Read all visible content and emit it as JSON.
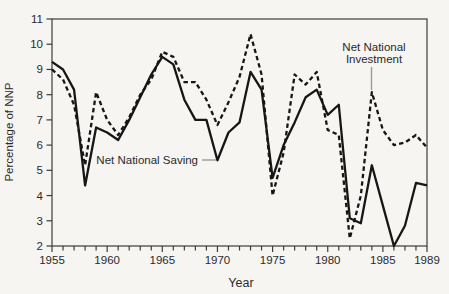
{
  "figure": {
    "background": "#f6f5f2",
    "line_color": "#161616",
    "leader_color": "#9b9b9b",
    "text_color": "#2a2a2a",
    "axis_color": "#3c3c3c"
  },
  "chart_data": {
    "type": "line",
    "title": "",
    "xlabel": "Year",
    "ylabel": "Percentage of NNP",
    "xlim": [
      1955,
      1989
    ],
    "ylim": [
      2,
      11
    ],
    "grid": false,
    "x": [
      1955,
      1956,
      1957,
      1958,
      1959,
      1960,
      1961,
      1962,
      1963,
      1964,
      1965,
      1966,
      1967,
      1968,
      1969,
      1970,
      1971,
      1972,
      1973,
      1974,
      1975,
      1976,
      1977,
      1978,
      1979,
      1980,
      1981,
      1982,
      1983,
      1984,
      1985,
      1986,
      1987,
      1988,
      1989
    ],
    "x_tick_labels": [
      1955,
      1960,
      1965,
      1970,
      1975,
      1980,
      1985,
      1989
    ],
    "y_ticks": [
      2,
      3,
      4,
      5,
      6,
      7,
      8,
      9,
      10,
      11
    ],
    "series": [
      {
        "name": "Net National Saving",
        "style": "solid",
        "values": [
          9.3,
          9.0,
          8.2,
          4.4,
          6.7,
          6.5,
          6.2,
          7.0,
          7.9,
          8.8,
          9.5,
          9.2,
          7.8,
          7.0,
          7.0,
          5.4,
          6.5,
          6.9,
          8.9,
          8.2,
          4.7,
          6.0,
          6.9,
          7.9,
          8.2,
          7.2,
          7.6,
          3.1,
          2.9,
          5.2,
          3.6,
          2.0,
          2.8,
          4.5,
          4.4
        ]
      },
      {
        "name": "Net National Investment",
        "style": "dashed",
        "values": [
          9.0,
          8.6,
          7.6,
          5.2,
          8.1,
          7.0,
          6.4,
          7.1,
          8.0,
          8.6,
          9.7,
          9.5,
          8.5,
          8.5,
          7.8,
          6.8,
          7.7,
          8.7,
          10.4,
          8.8,
          4.0,
          5.7,
          8.8,
          8.4,
          8.9,
          6.6,
          6.4,
          2.3,
          4.0,
          8.1,
          6.6,
          6.0,
          6.1,
          6.4,
          5.9
        ]
      }
    ],
    "annotations": [
      {
        "lines": [
          "Net National Saving"
        ],
        "series": "Net National Saving",
        "target_year": 1970
      },
      {
        "lines": [
          "Net National",
          "Investment"
        ],
        "series": "Net National Investment",
        "target_year": 1984
      }
    ]
  }
}
